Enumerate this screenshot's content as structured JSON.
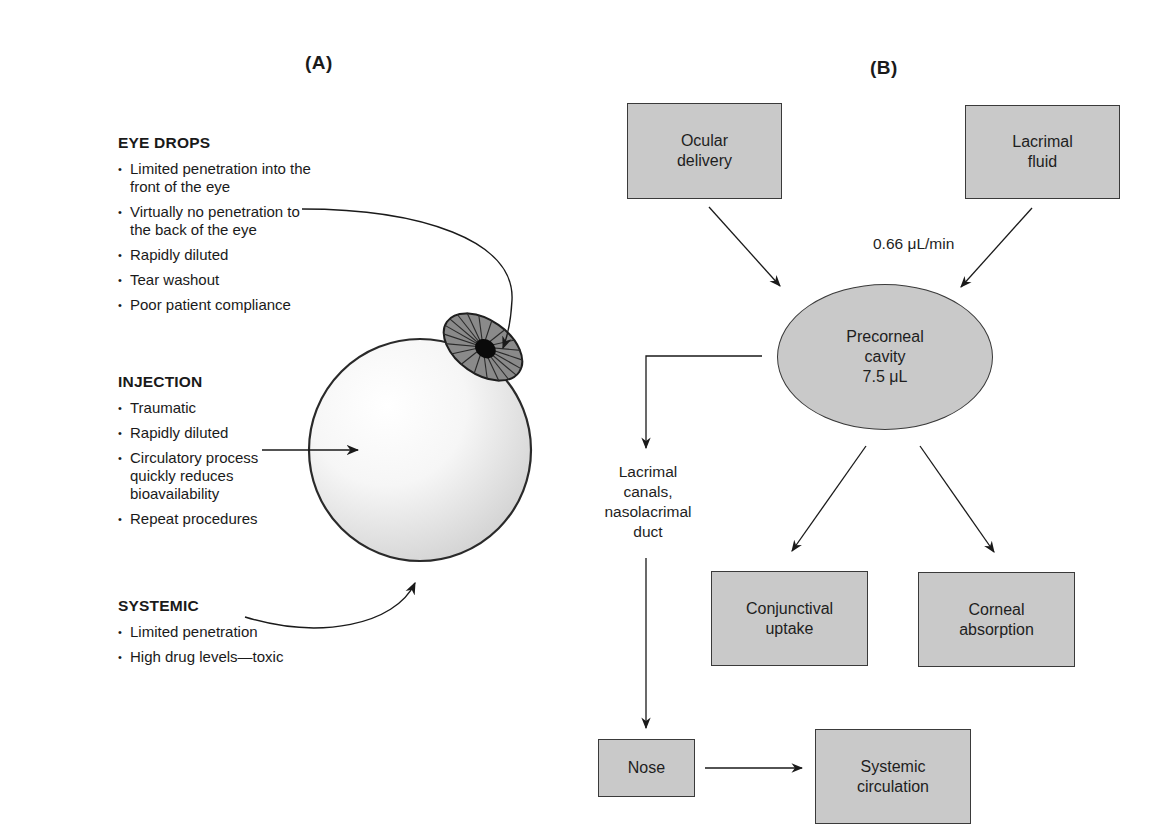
{
  "panels": {
    "a": {
      "label": "(A)",
      "sections": [
        {
          "heading": "EYE DROPS",
          "bullets": [
            "Limited penetration into the front of the eye",
            "Virtually no penetration to the back of the eye",
            "Rapidly diluted",
            "Tear washout",
            "Poor patient compliance"
          ]
        },
        {
          "heading": "INJECTION",
          "bullets": [
            "Traumatic",
            "Rapidly diluted",
            "Circulatory process quickly reduces bioavailability",
            "Repeat procedures"
          ]
        },
        {
          "heading": "SYSTEMIC",
          "bullets": [
            "Limited penetration",
            "High drug levels—toxic"
          ]
        }
      ],
      "illustration": "eyeball with iris and pupil; arrows from eye drops, injection, systemic routes"
    },
    "b": {
      "label": "(B)",
      "nodes": {
        "ocular_delivery": "Ocular\ndelivery",
        "lacrimal_fluid": "Lacrimal\nfluid",
        "precorneal_line1": "Precorneal",
        "precorneal_line2": "cavity",
        "precorneal_line3": "7.5 μL",
        "conjunctival_uptake": "Conjunctival\nuptake",
        "corneal_absorption": "Corneal\nabsorption",
        "nose": "Nose",
        "systemic_circulation": "Systemic\ncirculation"
      },
      "edge_labels": {
        "lacrimal_rate": "0.66 μL/min",
        "drainage": "Lacrimal\ncanals,\nnasolacrimal\nduct"
      }
    }
  },
  "colors": {
    "box_fill": "#c9c9c9",
    "box_border": "#3a3a3a",
    "iris": "#8a8a8a",
    "text": "#1a1a1a"
  }
}
